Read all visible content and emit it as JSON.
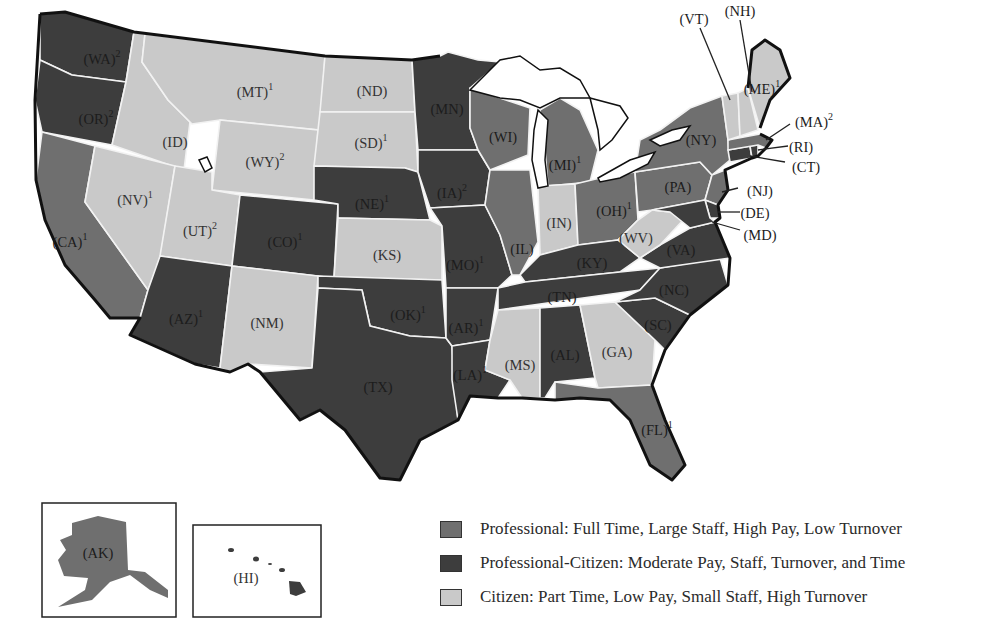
{
  "colors": {
    "professional": "#6f6f6f",
    "professional_citizen": "#3d3d3d",
    "citizen": "#c9c9c9",
    "lake": "#ffffff",
    "border": "#111111"
  },
  "legend": [
    {
      "key": "professional",
      "label": "Professional: Full Time, Large Staff, High Pay, Low Turnover"
    },
    {
      "key": "professional_citizen",
      "label": "Professional-Citizen: Moderate Pay, Staff, Turnover, and Time"
    },
    {
      "key": "citizen",
      "label": "Citizen: Part Time, Low Pay, Small Staff, High Turnover"
    }
  ],
  "states": {
    "WA": {
      "label": "(WA)",
      "sup": "2",
      "category": "professional_citizen"
    },
    "OR": {
      "label": "(OR)",
      "sup": "2",
      "category": "professional_citizen"
    },
    "CA": {
      "label": "(CA)",
      "sup": "1",
      "category": "professional"
    },
    "ID": {
      "label": "(ID)",
      "sup": "",
      "category": "citizen"
    },
    "NV": {
      "label": "(NV)",
      "sup": "1",
      "category": "citizen"
    },
    "MT": {
      "label": "(MT)",
      "sup": "1",
      "category": "citizen"
    },
    "WY": {
      "label": "(WY)",
      "sup": "2",
      "category": "citizen"
    },
    "UT": {
      "label": "(UT)",
      "sup": "2",
      "category": "citizen"
    },
    "AZ": {
      "label": "(AZ)",
      "sup": "1",
      "category": "professional_citizen"
    },
    "CO": {
      "label": "(CO)",
      "sup": "1",
      "category": "professional_citizen"
    },
    "NM": {
      "label": "(NM)",
      "sup": "",
      "category": "citizen"
    },
    "ND": {
      "label": "(ND)",
      "sup": "",
      "category": "citizen"
    },
    "SD": {
      "label": "(SD)",
      "sup": "1",
      "category": "citizen"
    },
    "NE": {
      "label": "(NE)",
      "sup": "1",
      "category": "professional_citizen"
    },
    "KS": {
      "label": "(KS)",
      "sup": "",
      "category": "citizen"
    },
    "OK": {
      "label": "(OK)",
      "sup": "1",
      "category": "professional_citizen"
    },
    "TX": {
      "label": "(TX)",
      "sup": "",
      "category": "professional_citizen"
    },
    "MN": {
      "label": "(MN)",
      "sup": "",
      "category": "professional_citizen"
    },
    "IA": {
      "label": "(IA)",
      "sup": "2",
      "category": "professional_citizen"
    },
    "MO": {
      "label": "(MO)",
      "sup": "1",
      "category": "professional_citizen"
    },
    "AR": {
      "label": "(AR)",
      "sup": "1",
      "category": "professional_citizen"
    },
    "LA": {
      "label": "(LA)",
      "sup": "1",
      "category": "professional_citizen"
    },
    "WI": {
      "label": "(WI)",
      "sup": "",
      "category": "professional"
    },
    "IL": {
      "label": "(IL)",
      "sup": "",
      "category": "professional"
    },
    "MI": {
      "label": "(MI)",
      "sup": "1",
      "category": "professional"
    },
    "IN": {
      "label": "(IN)",
      "sup": "",
      "category": "citizen"
    },
    "OH": {
      "label": "(OH)",
      "sup": "1",
      "category": "professional"
    },
    "KY": {
      "label": "(KY)",
      "sup": "",
      "category": "professional_citizen"
    },
    "TN": {
      "label": "(TN)",
      "sup": "",
      "category": "professional_citizen"
    },
    "MS": {
      "label": "(MS)",
      "sup": "",
      "category": "citizen"
    },
    "AL": {
      "label": "(AL)",
      "sup": "",
      "category": "professional_citizen"
    },
    "GA": {
      "label": "(GA)",
      "sup": "",
      "category": "citizen"
    },
    "FL": {
      "label": "(FL)",
      "sup": "1",
      "category": "professional"
    },
    "SC": {
      "label": "(SC)",
      "sup": "",
      "category": "professional_citizen"
    },
    "NC": {
      "label": "(NC)",
      "sup": "",
      "category": "professional_citizen"
    },
    "VA": {
      "label": "(VA)",
      "sup": "",
      "category": "professional_citizen"
    },
    "WV": {
      "label": "(WV)",
      "sup": "",
      "category": "citizen"
    },
    "PA": {
      "label": "(PA)",
      "sup": "",
      "category": "professional"
    },
    "NY": {
      "label": "(NY)",
      "sup": "",
      "category": "professional"
    },
    "NJ": {
      "label": "(NJ)",
      "sup": "",
      "category": "professional"
    },
    "DE": {
      "label": "(DE)",
      "sup": "",
      "category": "professional_citizen"
    },
    "MD": {
      "label": "(MD)",
      "sup": "",
      "category": "professional_citizen"
    },
    "CT": {
      "label": "(CT)",
      "sup": "",
      "category": "professional_citizen"
    },
    "RI": {
      "label": "(RI)",
      "sup": "",
      "category": "professional_citizen"
    },
    "MA": {
      "label": "(MA)",
      "sup": "2",
      "category": "professional"
    },
    "VT": {
      "label": "(VT)",
      "sup": "",
      "category": "citizen"
    },
    "NH": {
      "label": "(NH)",
      "sup": "",
      "category": "citizen"
    },
    "ME": {
      "label": "(ME)",
      "sup": "1",
      "category": "citizen"
    },
    "AK": {
      "label": "(AK)",
      "sup": "",
      "category": "professional"
    },
    "HI": {
      "label": "(HI)",
      "sup": "",
      "category": "professional_citizen"
    }
  }
}
